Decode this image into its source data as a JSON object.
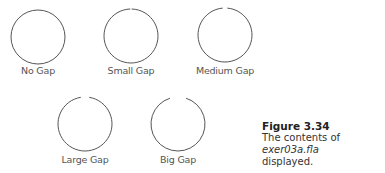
{
  "circles": [
    {
      "label": "No Gap",
      "cx": 38,
      "cy": 37,
      "gap_deg": 0
    },
    {
      "label": "Small Gap",
      "cx": 131,
      "cy": 36,
      "gap_deg": 3
    },
    {
      "label": "Medium Gap",
      "cx": 225,
      "cy": 35,
      "gap_deg": 10
    },
    {
      "label": "Large Gap",
      "cx": 85,
      "cy": 124,
      "gap_deg": 18
    },
    {
      "label": "Big Gap",
      "cx": 178,
      "cy": 124,
      "gap_deg": 35
    }
  ],
  "caption": {
    "figure": "Figure 3.34",
    "text_before": "The contents of ",
    "filename": "exer03a.fla",
    "text_after": "displayed."
  },
  "colors": {
    "stroke": "#555555",
    "text": "#555555"
  }
}
